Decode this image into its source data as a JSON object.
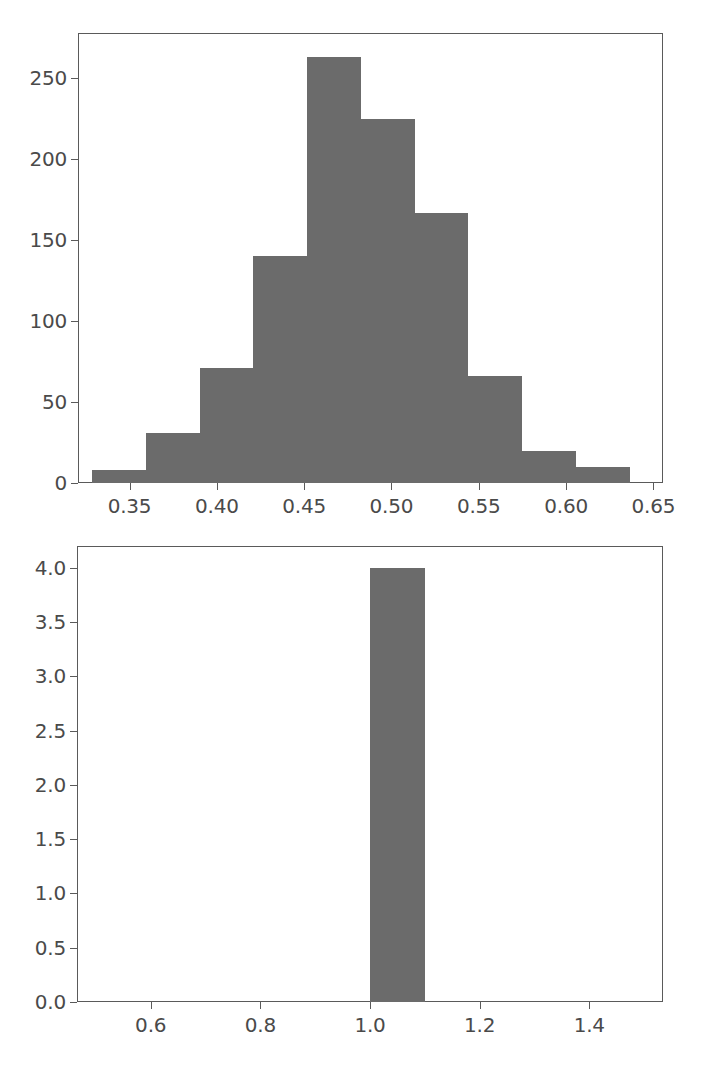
{
  "figure": {
    "background_color": "#ffffff",
    "bar_color": "#6b6b6b",
    "axis_color": "#5a5a5a",
    "tick_label_color": "#4a4a4a",
    "panel_count": 2
  },
  "chart_data": [
    {
      "type": "bar",
      "id": "top-histogram",
      "title": "",
      "subtitle": "",
      "xlabel": "",
      "ylabel": "",
      "legend": [],
      "grid": false,
      "xlim": [
        0.3205,
        0.6555
      ],
      "ylim": [
        0,
        278
      ],
      "xticks": [
        0.35,
        0.4,
        0.45,
        0.5,
        0.55,
        0.6,
        0.65
      ],
      "xticklabels": [
        "0.35",
        "0.40",
        "0.45",
        "0.50",
        "0.55",
        "0.60",
        "0.65"
      ],
      "yticks": [
        0,
        50,
        100,
        150,
        200,
        250
      ],
      "yticklabels": [
        "0",
        "50",
        "100",
        "150",
        "200",
        "250"
      ],
      "bin_edges": [
        0.3285,
        0.3593,
        0.3901,
        0.4209,
        0.4517,
        0.4825,
        0.5133,
        0.5441,
        0.5749,
        0.6057,
        0.6365
      ],
      "bin_centers": [
        0.3439,
        0.3747,
        0.4055,
        0.4363,
        0.4671,
        0.4979,
        0.5287,
        0.5595,
        0.5903,
        0.6211
      ],
      "values": [
        8,
        31,
        71,
        140,
        263,
        225,
        167,
        66,
        20,
        10
      ],
      "categories": [
        "0.329-0.359",
        "0.359-0.390",
        "0.390-0.421",
        "0.421-0.452",
        "0.452-0.483",
        "0.483-0.513",
        "0.513-0.544",
        "0.544-0.575",
        "0.575-0.606",
        "0.606-0.637"
      ],
      "annotations": []
    },
    {
      "type": "bar",
      "id": "bottom-histogram",
      "title": "",
      "subtitle": "",
      "xlabel": "",
      "ylabel": "",
      "legend": [],
      "grid": false,
      "xlim": [
        0.4655,
        1.5345
      ],
      "ylim": [
        0,
        4.2
      ],
      "xticks": [
        0.6,
        0.8,
        1.0,
        1.2,
        1.4
      ],
      "xticklabels": [
        "0.6",
        "0.8",
        "1.0",
        "1.2",
        "1.4"
      ],
      "yticks": [
        0.0,
        0.5,
        1.0,
        1.5,
        2.0,
        2.5,
        3.0,
        3.5,
        4.0
      ],
      "yticklabels": [
        "0.0",
        "0.5",
        "1.0",
        "1.5",
        "2.0",
        "2.5",
        "3.0",
        "3.5",
        "4.0"
      ],
      "bin_edges": [
        1.0,
        1.1
      ],
      "bin_centers": [
        1.05
      ],
      "values": [
        4.0
      ],
      "categories": [
        "1.0-1.1"
      ],
      "annotations": []
    }
  ]
}
